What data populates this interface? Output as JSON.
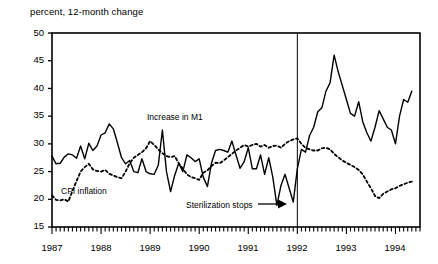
{
  "chart_data": {
    "type": "line",
    "title": "percent, 12-month change",
    "xlabel": "",
    "ylabel": "percent, 12-month change",
    "ylim": [
      15,
      50
    ],
    "yticks": [
      15,
      20,
      25,
      30,
      35,
      40,
      45,
      50
    ],
    "xlim": [
      1987.0,
      1994.5
    ],
    "xticks": [
      1987,
      1988,
      1989,
      1990,
      1991,
      1992,
      1993,
      1994
    ],
    "xtick_labels": [
      "1987",
      "1988",
      "1989",
      "1990",
      "1991",
      "1992",
      "1993",
      "1994"
    ],
    "minor_tick_interval_months": 1,
    "grid": false,
    "legend": "inline-annotations",
    "annotations": [
      {
        "text": "Increase in M1",
        "x": 1988.75,
        "y": 34.0,
        "name": "series-label-m1"
      },
      {
        "text": "CPI inflation",
        "x": 1987.25,
        "y": 20.6,
        "name": "series-label-cpi"
      },
      {
        "text": "Sterilization stops",
        "x": 1990.4,
        "y": 17.3,
        "name": "event-label-sterilization",
        "arrow": "→"
      }
    ],
    "event_line": {
      "x": 1992.0,
      "label": "Sterilization stops"
    },
    "series": [
      {
        "name": "Increase in M1",
        "style": "solid",
        "color": "#000000",
        "x": [
          1987.0,
          1987.083,
          1987.167,
          1987.25,
          1987.333,
          1987.417,
          1987.5,
          1987.583,
          1987.667,
          1987.75,
          1987.833,
          1987.917,
          1988.0,
          1988.083,
          1988.167,
          1988.25,
          1988.333,
          1988.417,
          1988.5,
          1988.583,
          1988.667,
          1988.75,
          1988.833,
          1988.917,
          1989.0,
          1989.083,
          1989.167,
          1989.25,
          1989.333,
          1989.417,
          1989.5,
          1989.583,
          1989.667,
          1989.75,
          1989.833,
          1989.917,
          1990.0,
          1990.083,
          1990.167,
          1990.25,
          1990.333,
          1990.417,
          1990.5,
          1990.583,
          1990.667,
          1990.75,
          1990.833,
          1990.917,
          1991.0,
          1991.083,
          1991.167,
          1991.25,
          1991.333,
          1991.417,
          1991.5,
          1991.583,
          1991.667,
          1991.75,
          1991.833,
          1991.917,
          1992.0,
          1992.083,
          1992.167,
          1992.25,
          1992.333,
          1992.417,
          1992.5,
          1992.583,
          1992.667,
          1992.75,
          1992.833,
          1992.917,
          1993.0,
          1993.083,
          1993.167,
          1993.25,
          1993.333,
          1993.417,
          1993.5,
          1993.583,
          1993.667,
          1993.75,
          1993.833,
          1993.917,
          1994.0,
          1994.083,
          1994.167,
          1994.25,
          1994.333
        ],
        "values": [
          27.8,
          26.4,
          26.5,
          27.6,
          28.2,
          28.0,
          27.4,
          29.6,
          27.3,
          30.1,
          28.8,
          29.6,
          31.6,
          32.0,
          33.6,
          32.7,
          30.2,
          27.5,
          26.4,
          27.0,
          25.0,
          24.8,
          27.3,
          25.0,
          24.6,
          24.5,
          26.2,
          32.5,
          25.0,
          21.4,
          24.3,
          26.5,
          25.0,
          28.0,
          27.5,
          26.8,
          27.3,
          24.0,
          22.3,
          26.5,
          28.8,
          29.0,
          28.8,
          28.5,
          30.5,
          28.0,
          25.6,
          26.8,
          29.3,
          25.5,
          25.5,
          28.0,
          24.5,
          27.5,
          24.0,
          18.9,
          22.5,
          24.5,
          22.0,
          19.5,
          25.5,
          29.0,
          28.5,
          31.5,
          33.0,
          35.8,
          36.5,
          39.5,
          41.0,
          46.0,
          43.0,
          40.5,
          38.0,
          35.5,
          35.0,
          37.6,
          34.0,
          32.0,
          30.5,
          33.0,
          36.0,
          34.5,
          33.0,
          32.5,
          30.0,
          35.0,
          38.0,
          37.5,
          39.5
        ]
      },
      {
        "name": "CPI inflation",
        "style": "dashed",
        "color": "#000000",
        "x": [
          1987.0,
          1987.083,
          1987.167,
          1987.25,
          1987.333,
          1987.417,
          1987.5,
          1987.583,
          1987.667,
          1987.75,
          1987.833,
          1987.917,
          1988.0,
          1988.083,
          1988.167,
          1988.25,
          1988.333,
          1988.417,
          1988.5,
          1988.583,
          1988.667,
          1988.75,
          1988.833,
          1988.917,
          1989.0,
          1989.083,
          1989.167,
          1989.25,
          1989.333,
          1989.417,
          1989.5,
          1989.583,
          1989.667,
          1989.75,
          1989.833,
          1989.917,
          1990.0,
          1990.083,
          1990.167,
          1990.25,
          1990.333,
          1990.417,
          1990.5,
          1990.583,
          1990.667,
          1990.75,
          1990.833,
          1990.917,
          1991.0,
          1991.083,
          1991.167,
          1991.25,
          1991.333,
          1991.417,
          1991.5,
          1991.583,
          1991.667,
          1991.75,
          1991.833,
          1991.917,
          1992.0,
          1992.083,
          1992.167,
          1992.25,
          1992.333,
          1992.417,
          1992.5,
          1992.583,
          1992.667,
          1992.75,
          1992.833,
          1992.917,
          1993.0,
          1993.083,
          1993.167,
          1993.25,
          1993.333,
          1993.417,
          1993.5,
          1993.583,
          1993.667,
          1993.75,
          1993.833,
          1993.917,
          1994.0,
          1994.083,
          1994.167,
          1994.25,
          1994.333
        ],
        "values": [
          20.7,
          19.9,
          19.8,
          20.0,
          19.6,
          21.5,
          23.3,
          25.0,
          25.8,
          26.4,
          25.4,
          25.1,
          25.0,
          25.3,
          24.6,
          24.3,
          24.0,
          23.8,
          25.0,
          26.5,
          27.5,
          28.0,
          28.5,
          29.2,
          30.5,
          29.8,
          29.0,
          28.3,
          27.8,
          27.6,
          27.8,
          26.5,
          25.5,
          24.5,
          24.0,
          23.8,
          23.5,
          24.8,
          25.2,
          26.0,
          26.6,
          26.5,
          27.0,
          27.6,
          28.2,
          28.8,
          29.3,
          29.8,
          29.5,
          29.8,
          30.0,
          29.5,
          29.8,
          29.3,
          29.6,
          29.7,
          29.3,
          30.0,
          30.5,
          30.8,
          31.0,
          30.0,
          29.3,
          29.0,
          28.8,
          28.8,
          29.2,
          29.3,
          29.0,
          28.2,
          27.6,
          27.0,
          26.6,
          26.2,
          25.8,
          25.3,
          24.5,
          23.2,
          22.0,
          20.6,
          20.2,
          21.0,
          21.4,
          21.8,
          22.0,
          22.4,
          22.7,
          23.0,
          23.2
        ]
      }
    ]
  }
}
